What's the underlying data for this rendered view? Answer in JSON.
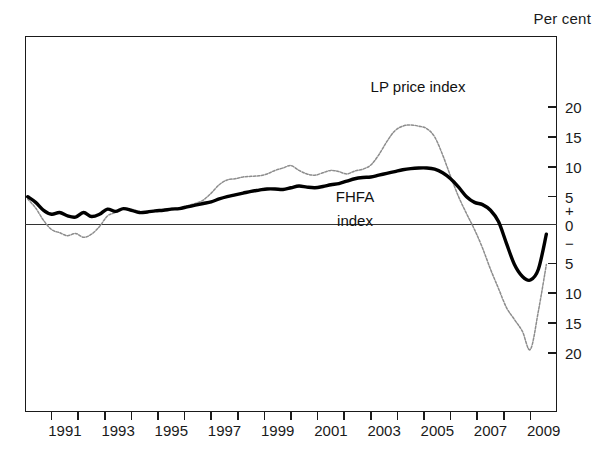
{
  "header": {
    "unit_label": "Per cent"
  },
  "annotations": {
    "lp_label": "LP price index",
    "fhfa_label_line1": "FHFA",
    "fhfa_label_line2": "index"
  },
  "axes": {
    "y_ticks": [
      "20",
      "15",
      "10",
      "5",
      "5",
      "10",
      "15",
      "20"
    ],
    "y_zero": "0",
    "y_plus_sign": "+",
    "y_minus_sign": "−",
    "x_labels": [
      "1991",
      "1993",
      "1995",
      "1997",
      "1999",
      "2001",
      "2003",
      "2005",
      "2007",
      "2009"
    ]
  },
  "colors": {
    "fhfa": "#000000",
    "lp": "#8d8d8d",
    "axis": "#1a1a1a",
    "background": "#ffffff"
  },
  "chart_data": {
    "type": "line",
    "title": "",
    "subtitle": "",
    "xlabel": "",
    "ylabel": "Per cent",
    "xlim": [
      1990.0,
      2010.0
    ],
    "ylim": [
      -22,
      22
    ],
    "grid": false,
    "legend": "inline-annotations",
    "y_tick_values": [
      20,
      15,
      10,
      5,
      0,
      -5,
      -10,
      -15,
      -20
    ],
    "x_tick_values": [
      1990,
      1991,
      1992,
      1993,
      1994,
      1995,
      1996,
      1997,
      1998,
      1999,
      2000,
      2001,
      2002,
      2003,
      2004,
      2005,
      2006,
      2007,
      2008,
      2009,
      2010
    ],
    "x_labelled_ticks": [
      1991,
      1993,
      1995,
      1997,
      1999,
      2001,
      2003,
      2005,
      2007,
      2009
    ],
    "series": [
      {
        "name": "FHFA index",
        "style": "solid-thick-black",
        "x": [
          1990.1,
          1990.4,
          1990.7,
          1991.0,
          1991.3,
          1991.6,
          1991.9,
          1992.2,
          1992.5,
          1992.8,
          1993.1,
          1993.4,
          1993.7,
          1994.0,
          1994.3,
          1994.6,
          1994.9,
          1995.2,
          1995.5,
          1995.8,
          1996.1,
          1996.4,
          1996.7,
          1997.0,
          1997.3,
          1997.6,
          1997.9,
          1998.2,
          1998.5,
          1998.8,
          1999.1,
          1999.4,
          1999.7,
          2000.0,
          2000.3,
          2000.6,
          2000.9,
          2001.2,
          2001.5,
          2001.8,
          2002.1,
          2002.4,
          2002.7,
          2003.0,
          2003.3,
          2003.6,
          2003.9,
          2004.2,
          2004.5,
          2004.8,
          2005.1,
          2005.4,
          2005.7,
          2006.0,
          2006.3,
          2006.6,
          2006.9,
          2007.2,
          2007.5,
          2007.8,
          2008.1,
          2008.4,
          2008.7,
          2009.0,
          2009.3,
          2009.6
        ],
        "y": [
          5.0,
          4.0,
          2.6,
          1.9,
          2.2,
          1.6,
          1.4,
          2.2,
          1.5,
          1.9,
          2.8,
          2.4,
          2.9,
          2.6,
          2.2,
          2.3,
          2.5,
          2.6,
          2.8,
          2.9,
          3.2,
          3.5,
          3.8,
          4.1,
          4.6,
          5.0,
          5.3,
          5.6,
          5.9,
          6.1,
          6.3,
          6.3,
          6.2,
          6.5,
          6.8,
          6.6,
          6.5,
          6.7,
          7.0,
          7.2,
          7.6,
          8.0,
          8.2,
          8.3,
          8.6,
          8.9,
          9.2,
          9.5,
          9.7,
          9.8,
          9.8,
          9.6,
          9.0,
          8.0,
          6.6,
          5.0,
          4.0,
          3.6,
          2.6,
          0.6,
          -2.4,
          -5.2,
          -7.2,
          -7.8,
          -6.0,
          -1.2
        ]
      },
      {
        "name": "LP price index",
        "style": "dotted-thin-grey",
        "x": [
          1990.1,
          1990.4,
          1990.7,
          1991.0,
          1991.3,
          1991.6,
          1991.9,
          1992.2,
          1992.5,
          1992.8,
          1993.1,
          1993.4,
          1993.7,
          1994.0,
          1994.3,
          1994.6,
          1994.9,
          1995.2,
          1995.5,
          1995.8,
          1996.1,
          1996.4,
          1996.7,
          1997.0,
          1997.3,
          1997.6,
          1997.9,
          1998.2,
          1998.5,
          1998.8,
          1999.1,
          1999.4,
          1999.7,
          2000.0,
          2000.3,
          2000.6,
          2000.9,
          2001.2,
          2001.5,
          2001.8,
          2002.1,
          2002.4,
          2002.7,
          2003.0,
          2003.3,
          2003.6,
          2003.9,
          2004.2,
          2004.5,
          2004.8,
          2005.1,
          2005.4,
          2005.7,
          2006.0,
          2006.3,
          2006.6,
          2006.9,
          2007.2,
          2007.5,
          2007.8,
          2008.1,
          2008.4,
          2008.7,
          2009.0,
          2009.3,
          2009.6
        ],
        "y": [
          4.6,
          3.0,
          0.8,
          -0.6,
          -1.0,
          -1.4,
          -1.1,
          -1.6,
          -1.2,
          -0.2,
          1.6,
          2.2,
          2.9,
          2.8,
          2.4,
          2.3,
          2.6,
          2.7,
          2.9,
          3.0,
          3.4,
          3.8,
          4.4,
          5.6,
          7.0,
          7.8,
          8.0,
          8.3,
          8.4,
          8.5,
          8.8,
          9.4,
          9.8,
          10.2,
          9.4,
          8.8,
          8.6,
          9.0,
          9.4,
          9.2,
          8.8,
          9.3,
          9.6,
          10.3,
          12.0,
          14.2,
          16.0,
          16.8,
          17.0,
          16.8,
          16.4,
          15.0,
          12.0,
          8.4,
          5.0,
          2.0,
          -0.6,
          -3.0,
          -6.0,
          -9.2,
          -12.4,
          -14.4,
          -16.4,
          -19.4,
          -13.0,
          -5.2
        ]
      }
    ]
  }
}
